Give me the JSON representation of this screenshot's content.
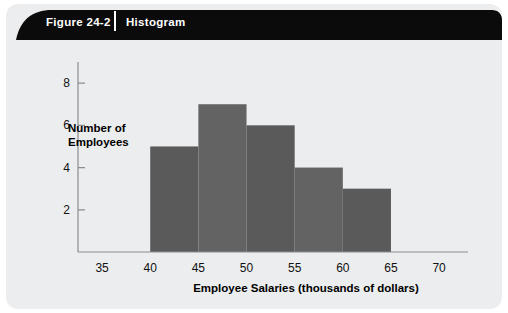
{
  "figure": {
    "number_label": "Figure 24-2",
    "title_label": "Histogram"
  },
  "colors": {
    "card_background": "#ecedee",
    "banner": "#0b0b0b",
    "banner_text": "#ffffff",
    "bar_dark": "#5a5a5a",
    "bar_light": "#636363",
    "axis": "#8b8d8e"
  },
  "chart_data": {
    "type": "bar",
    "title": "Histogram",
    "xlabel": "Employee Salaries (thousands of dollars)",
    "ylabel": "Number of Employees",
    "ylabel_lines": [
      "Number of",
      "Employees"
    ],
    "categories": [
      "40-45",
      "45-50",
      "50-55",
      "55-60",
      "60-65"
    ],
    "bin_edges": [
      40,
      45,
      50,
      55,
      60,
      65
    ],
    "values": [
      5,
      7,
      6,
      4,
      3
    ],
    "bar_colors": [
      "#5a5a5a",
      "#636363",
      "#5a5a5a",
      "#636363",
      "#5a5a5a"
    ],
    "xlim": [
      32.5,
      73
    ],
    "ylim": [
      0,
      9
    ],
    "xticks": [
      35,
      40,
      45,
      50,
      55,
      60,
      65,
      70
    ],
    "xtick_labels": [
      "35",
      "40",
      "45",
      "50",
      "55",
      "60",
      "65",
      "70"
    ],
    "yticks": [
      2,
      4,
      6,
      8
    ],
    "ytick_labels": [
      "2",
      "4",
      "6",
      "8"
    ],
    "grid": false,
    "legend": null
  }
}
